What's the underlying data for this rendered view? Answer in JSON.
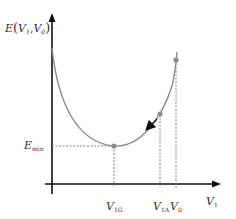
{
  "diagram": {
    "y_axis_label": {
      "main": "E",
      "open": "(",
      "v1": "V",
      "v1_sub": "1",
      "comma": ",",
      "v0": "V",
      "v0_sub": "0",
      "close": ")"
    },
    "x_axis_label": {
      "main": "V",
      "sub": "1"
    },
    "emin_label": {
      "main": "E",
      "sub": "min"
    },
    "ticks": [
      {
        "main": "V",
        "sub": "1G"
      },
      {
        "main": "V",
        "sub": "1A"
      },
      {
        "main": "V",
        "sub": "0"
      }
    ],
    "colors": {
      "axis": "#111111",
      "curve": "#8a8a8a",
      "point": "#8c8c8c",
      "dashed": "#777777",
      "arrow": "#111111"
    }
  }
}
